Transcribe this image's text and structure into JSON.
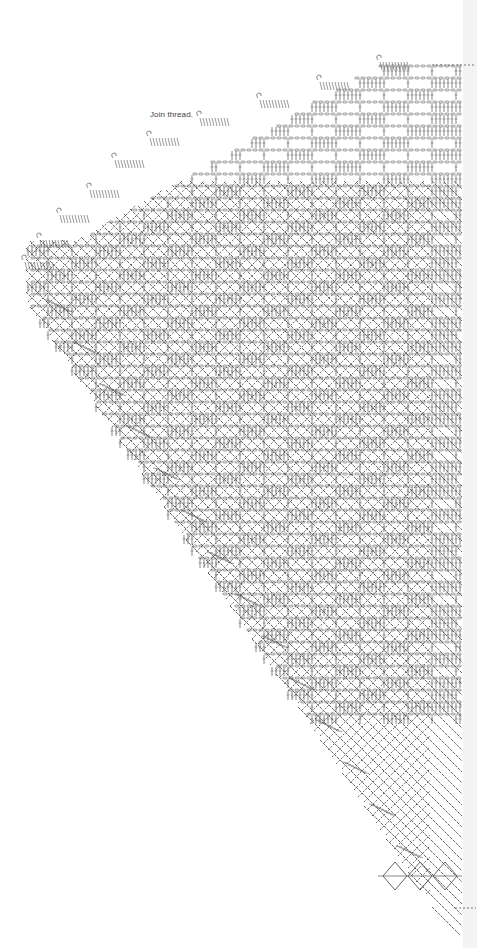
{
  "diagram": {
    "type": "crochet-chart",
    "annotations": [
      {
        "text": "Join thread.",
        "x": 150,
        "y": 116
      }
    ],
    "colors": {
      "background": "#ffffff",
      "stitch": "#555555",
      "edge_strip": "#f4f4f4"
    },
    "regions": {
      "upper_band": {
        "top": 62,
        "left": 20,
        "right": 462
      },
      "diagonal_band": {
        "from": [
          40,
          230
        ],
        "to": [
          420,
          890
        ]
      },
      "right_edge_x": 462
    }
  }
}
